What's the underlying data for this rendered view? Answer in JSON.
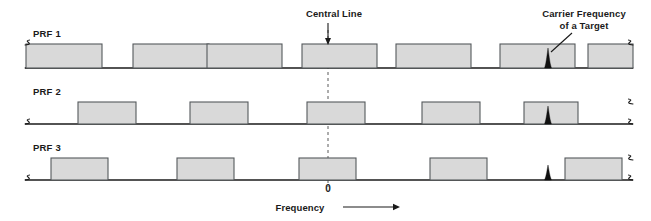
{
  "figure": {
    "title": "",
    "background_color": "#ffffff",
    "width": 651,
    "height": 221
  },
  "annotations": {
    "central_line": {
      "label": "Central Line",
      "x": 328,
      "text_x": 334,
      "text_y": 17
    },
    "carrier_frequency": {
      "label_line1": "Carrier Frequency",
      "label_line2": "of a Target",
      "text_x": 584,
      "text_y1": 17,
      "text_y2": 29
    },
    "zero": {
      "label": "0",
      "x": 328,
      "y": 192
    },
    "axis_title": {
      "label": "Frequency",
      "x": 300,
      "y": 211,
      "arrow_from_x": 343,
      "arrow_to_x": 394,
      "arrow_y": 207
    }
  },
  "colors": {
    "block_fill": "#d9d9d9",
    "block_stroke": "#55595c",
    "axis": "#1a1a1a",
    "spike": "#111111",
    "text": "#1a1a1a",
    "dash": "#5a5a5a"
  },
  "chart_data": {
    "type": "bar",
    "title": "",
    "xlabel": "Frequency",
    "ylabel": "",
    "grid": false,
    "legend": "none",
    "x_axis_note": "Frequency axis, broken at both ends (squiggle breaks); central line marks 0",
    "rows": [
      {
        "name": "PRF 1",
        "label": "PRF 1",
        "label_x": 33,
        "label_y": 37,
        "baseline_y": 68,
        "block_top_y": 44,
        "block_height": 24,
        "axis_x_start": 26,
        "axis_x_end": 630,
        "blocks": [
          {
            "x": 26,
            "width": 76
          },
          {
            "x": 133,
            "width": 76
          },
          {
            "x": 207,
            "width": 75
          },
          {
            "x": 302,
            "width": 75
          },
          {
            "x": 396,
            "width": 75
          },
          {
            "x": 500,
            "width": 75
          },
          {
            "x": 588,
            "width": 45
          }
        ],
        "spikes": [
          {
            "x": 548,
            "height": 20
          }
        ]
      },
      {
        "name": "PRF 2",
        "label": "PRF 2",
        "label_x": 33,
        "label_y": 95,
        "baseline_y": 124,
        "block_top_y": 102,
        "block_height": 22,
        "axis_x_start": 26,
        "axis_x_end": 630,
        "blocks": [
          {
            "x": 78,
            "width": 58
          },
          {
            "x": 190,
            "width": 58
          },
          {
            "x": 307,
            "width": 58
          },
          {
            "x": 422,
            "width": 58
          },
          {
            "x": 524,
            "width": 54
          }
        ],
        "spikes": [
          {
            "x": 548,
            "height": 18
          }
        ]
      },
      {
        "name": "PRF 3",
        "label": "PRF 3",
        "label_x": 33,
        "label_y": 151,
        "baseline_y": 180,
        "block_top_y": 158,
        "block_height": 22,
        "axis_x_start": 26,
        "axis_x_end": 630,
        "blocks": [
          {
            "x": 51,
            "width": 57
          },
          {
            "x": 177,
            "width": 57
          },
          {
            "x": 299,
            "width": 57
          },
          {
            "x": 430,
            "width": 57
          },
          {
            "x": 565,
            "width": 57
          }
        ],
        "spikes": [
          {
            "x": 548,
            "height": 15
          }
        ]
      }
    ]
  }
}
